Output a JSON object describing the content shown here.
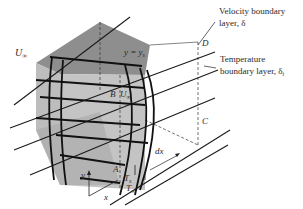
{
  "diagram": {
    "labels": {
      "u_inf_left": "U",
      "u_inf_left_sub": "∞",
      "y_eq": "y = y",
      "y_eq_sub": "s",
      "point_a": "A",
      "point_b": "B",
      "point_c": "C",
      "point_d": "D",
      "u_inf_b": "U",
      "u_inf_b_sub": "∞",
      "dx": "dx",
      "y_axis": "y",
      "x_axis": "x",
      "t_s": "T",
      "t_s_sub": "s",
      "t_inf": "T",
      "t_inf_sub": "∞"
    },
    "annotations": {
      "velocity_line1": "Velocity boundary",
      "velocity_line2": "layer, δ",
      "temperature_line1": "Temperature",
      "temperature_line2": "boundary layer, δ",
      "temperature_sub": "t"
    },
    "colors": {
      "box_top": "#8c8c8c",
      "box_front": "#b4b4b4",
      "box_bottom": "#a8a8a8",
      "ink": "#1a1a1a"
    }
  }
}
